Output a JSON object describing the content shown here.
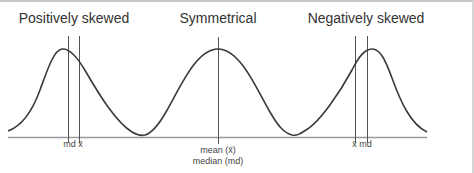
{
  "titles": {
    "positive": "Positively skewed",
    "symmetric": "Symmetrical",
    "negative": "Negatively skewed"
  },
  "labels": {
    "positive": "md x̄",
    "symmetric_line1": "mean (x̄)",
    "symmetric_line2": "median (md)",
    "negative": "x̄ md"
  },
  "colors": {
    "curve": "#3a3a3a",
    "lines": "#555555",
    "baseline": "#9a9a9a",
    "border": "#c8c8c8"
  }
}
